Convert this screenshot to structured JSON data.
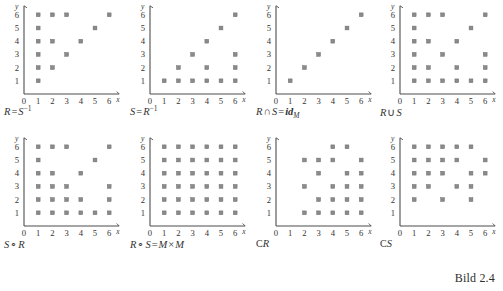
{
  "figure": {
    "label": "Bild 2.4",
    "axis": {
      "x_name": "x",
      "y_name": "y",
      "x_ticks": [
        "0",
        "1",
        "2",
        "3",
        "4",
        "5",
        "6"
      ],
      "y_ticks": [
        "0",
        "1",
        "2",
        "3",
        "4",
        "5",
        "6"
      ],
      "x_range": [
        0,
        6
      ],
      "y_range": [
        0,
        6
      ]
    },
    "point_color": "#8a8a8a",
    "axis_color": "#4d4d4d"
  },
  "chart_data": [
    {
      "type": "scatter",
      "title": "R = S^-1",
      "caption_parts": {
        "lhs": "R",
        "eq": "=",
        "rhs": "S",
        "exp": "−1"
      },
      "xlabel": "x",
      "ylabel": "y",
      "xlim": [
        0,
        6
      ],
      "ylim": [
        0,
        6
      ],
      "grid": false,
      "points": [
        [
          1,
          1
        ],
        [
          1,
          2
        ],
        [
          2,
          2
        ],
        [
          1,
          3
        ],
        [
          3,
          3
        ],
        [
          1,
          4
        ],
        [
          2,
          4
        ],
        [
          4,
          4
        ],
        [
          1,
          5
        ],
        [
          5,
          5
        ],
        [
          1,
          6
        ],
        [
          2,
          6
        ],
        [
          3,
          6
        ],
        [
          6,
          6
        ]
      ]
    },
    {
      "type": "scatter",
      "title": "S = R^-1",
      "caption_parts": {
        "lhs": "S",
        "eq": "=",
        "rhs": "R",
        "exp": "−1"
      },
      "xlabel": "x",
      "ylabel": "y",
      "xlim": [
        0,
        6
      ],
      "ylim": [
        0,
        6
      ],
      "grid": false,
      "points": [
        [
          1,
          1
        ],
        [
          2,
          1
        ],
        [
          3,
          1
        ],
        [
          4,
          1
        ],
        [
          5,
          1
        ],
        [
          6,
          1
        ],
        [
          2,
          2
        ],
        [
          4,
          2
        ],
        [
          6,
          2
        ],
        [
          3,
          3
        ],
        [
          6,
          3
        ],
        [
          4,
          4
        ],
        [
          5,
          5
        ],
        [
          6,
          6
        ]
      ]
    },
    {
      "type": "scatter",
      "title": "R ∩ S = id_M",
      "caption_parts": {
        "lhs": "R",
        "op": "∩",
        "mid": "S",
        "eq": "=",
        "rhs": "id",
        "sub": "M"
      },
      "xlabel": "x",
      "ylabel": "y",
      "xlim": [
        0,
        6
      ],
      "ylim": [
        0,
        6
      ],
      "grid": false,
      "points": [
        [
          1,
          1
        ],
        [
          2,
          2
        ],
        [
          3,
          3
        ],
        [
          4,
          4
        ],
        [
          5,
          5
        ],
        [
          6,
          6
        ]
      ]
    },
    {
      "type": "scatter",
      "title": "R ∪ S",
      "caption_parts": {
        "lhs": "R",
        "op": "∪",
        "rhs": "S"
      },
      "xlabel": "x",
      "ylabel": "y",
      "xlim": [
        0,
        6
      ],
      "ylim": [
        0,
        6
      ],
      "grid": false,
      "points": [
        [
          1,
          1
        ],
        [
          2,
          1
        ],
        [
          3,
          1
        ],
        [
          4,
          1
        ],
        [
          5,
          1
        ],
        [
          6,
          1
        ],
        [
          1,
          2
        ],
        [
          2,
          2
        ],
        [
          4,
          2
        ],
        [
          6,
          2
        ],
        [
          1,
          3
        ],
        [
          3,
          3
        ],
        [
          6,
          3
        ],
        [
          1,
          4
        ],
        [
          2,
          4
        ],
        [
          4,
          4
        ],
        [
          1,
          5
        ],
        [
          5,
          5
        ],
        [
          1,
          6
        ],
        [
          2,
          6
        ],
        [
          3,
          6
        ],
        [
          6,
          6
        ]
      ]
    },
    {
      "type": "scatter",
      "title": "S ∘ R",
      "caption_parts": {
        "lhs": "S",
        "op": "∘",
        "rhs": "R"
      },
      "xlabel": "x",
      "ylabel": "y",
      "xlim": [
        0,
        6
      ],
      "ylim": [
        0,
        6
      ],
      "grid": false,
      "points": [
        [
          1,
          1
        ],
        [
          2,
          1
        ],
        [
          3,
          1
        ],
        [
          4,
          1
        ],
        [
          5,
          1
        ],
        [
          6,
          1
        ],
        [
          1,
          2
        ],
        [
          2,
          2
        ],
        [
          3,
          2
        ],
        [
          4,
          2
        ],
        [
          6,
          2
        ],
        [
          1,
          3
        ],
        [
          2,
          3
        ],
        [
          3,
          3
        ],
        [
          6,
          3
        ],
        [
          1,
          4
        ],
        [
          2,
          4
        ],
        [
          4,
          4
        ],
        [
          1,
          5
        ],
        [
          5,
          5
        ],
        [
          1,
          6
        ],
        [
          2,
          6
        ],
        [
          3,
          6
        ],
        [
          6,
          6
        ]
      ]
    },
    {
      "type": "scatter",
      "title": "R ∘ S = M × M",
      "caption_parts": {
        "lhs": "R",
        "op": "∘",
        "mid": "S",
        "eq": "=",
        "rhs": "M × M"
      },
      "xlabel": "x",
      "ylabel": "y",
      "xlim": [
        0,
        6
      ],
      "ylim": [
        0,
        6
      ],
      "grid": false,
      "points": [
        [
          1,
          1
        ],
        [
          2,
          1
        ],
        [
          3,
          1
        ],
        [
          4,
          1
        ],
        [
          5,
          1
        ],
        [
          6,
          1
        ],
        [
          1,
          2
        ],
        [
          2,
          2
        ],
        [
          3,
          2
        ],
        [
          4,
          2
        ],
        [
          5,
          2
        ],
        [
          6,
          2
        ],
        [
          1,
          3
        ],
        [
          2,
          3
        ],
        [
          3,
          3
        ],
        [
          4,
          3
        ],
        [
          5,
          3
        ],
        [
          6,
          3
        ],
        [
          1,
          4
        ],
        [
          2,
          4
        ],
        [
          3,
          4
        ],
        [
          4,
          4
        ],
        [
          5,
          4
        ],
        [
          6,
          4
        ],
        [
          1,
          5
        ],
        [
          2,
          5
        ],
        [
          3,
          5
        ],
        [
          4,
          5
        ],
        [
          5,
          5
        ],
        [
          6,
          5
        ],
        [
          1,
          6
        ],
        [
          2,
          6
        ],
        [
          3,
          6
        ],
        [
          4,
          6
        ],
        [
          5,
          6
        ],
        [
          6,
          6
        ]
      ]
    },
    {
      "type": "scatter",
      "title": "CR",
      "caption_parts": {
        "lhs": "C",
        "rhs": "R"
      },
      "xlabel": "x",
      "ylabel": "y",
      "xlim": [
        0,
        6
      ],
      "ylim": [
        0,
        6
      ],
      "grid": false,
      "points": [
        [
          2,
          1
        ],
        [
          3,
          1
        ],
        [
          4,
          1
        ],
        [
          5,
          1
        ],
        [
          6,
          1
        ],
        [
          3,
          2
        ],
        [
          4,
          2
        ],
        [
          5,
          2
        ],
        [
          6,
          2
        ],
        [
          2,
          3
        ],
        [
          4,
          3
        ],
        [
          5,
          3
        ],
        [
          6,
          3
        ],
        [
          3,
          4
        ],
        [
          5,
          4
        ],
        [
          6,
          4
        ],
        [
          2,
          5
        ],
        [
          3,
          5
        ],
        [
          4,
          5
        ],
        [
          6,
          5
        ],
        [
          4,
          6
        ],
        [
          5,
          6
        ]
      ]
    },
    {
      "type": "scatter",
      "title": "CS",
      "caption_parts": {
        "lhs": "C",
        "rhs": "S"
      },
      "xlabel": "x",
      "ylabel": "y",
      "xlim": [
        0,
        6
      ],
      "ylim": [
        0,
        6
      ],
      "grid": false,
      "points": [
        [
          1,
          2
        ],
        [
          3,
          2
        ],
        [
          5,
          2
        ],
        [
          1,
          3
        ],
        [
          2,
          3
        ],
        [
          4,
          3
        ],
        [
          5,
          3
        ],
        [
          1,
          4
        ],
        [
          2,
          4
        ],
        [
          3,
          4
        ],
        [
          5,
          4
        ],
        [
          6,
          4
        ],
        [
          1,
          5
        ],
        [
          2,
          5
        ],
        [
          3,
          5
        ],
        [
          4,
          5
        ],
        [
          6,
          5
        ],
        [
          1,
          6
        ],
        [
          2,
          6
        ],
        [
          3,
          6
        ],
        [
          4,
          6
        ],
        [
          5,
          6
        ]
      ]
    }
  ]
}
